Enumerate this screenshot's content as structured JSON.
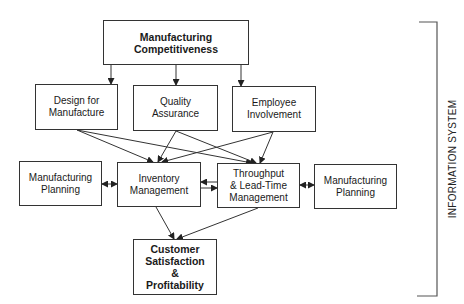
{
  "diagram": {
    "nodes": {
      "top": {
        "label": "Manufacturing\nCompetitiveness"
      },
      "design": {
        "label": "Design for\nManufacture"
      },
      "quality": {
        "label": "Quality\nAssurance"
      },
      "employee": {
        "label": "Employee\nInvolvement"
      },
      "planning_left": {
        "label": "Manufacturing\nPlanning"
      },
      "inventory": {
        "label": "Inventory\nManagement"
      },
      "throughput": {
        "label": "Throughput\n& Lead-Time\nManagement"
      },
      "planning_right": {
        "label": "Manufacturing\nPlanning"
      },
      "customer": {
        "label": "Customer\nSatisfaction\n&\nProfitability"
      }
    },
    "edges": [
      {
        "from": "top",
        "to": "design"
      },
      {
        "from": "top",
        "to": "quality"
      },
      {
        "from": "top",
        "to": "employee"
      },
      {
        "from": "design",
        "to": "inventory"
      },
      {
        "from": "design",
        "to": "throughput"
      },
      {
        "from": "quality",
        "to": "inventory"
      },
      {
        "from": "quality",
        "to": "throughput"
      },
      {
        "from": "employee",
        "to": "inventory"
      },
      {
        "from": "employee",
        "to": "throughput"
      },
      {
        "from": "planning_left",
        "to": "inventory",
        "bidirectional": true
      },
      {
        "from": "throughput",
        "to": "inventory"
      },
      {
        "from": "inventory",
        "to": "throughput"
      },
      {
        "from": "throughput",
        "to": "planning_right",
        "bidirectional": true
      },
      {
        "from": "inventory",
        "to": "customer"
      },
      {
        "from": "throughput",
        "to": "customer"
      }
    ],
    "bracket_label": "INFORMATION SYSTEM"
  }
}
